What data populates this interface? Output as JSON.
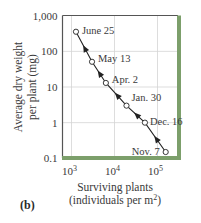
{
  "panel_label": "(b)",
  "colors": {
    "frame": "#555555",
    "accent_bar": "#7c9f6b",
    "grid": "#d4d4d4",
    "line": "#222222"
  },
  "chart_data": {
    "type": "line",
    "title": "",
    "xlabel": "Surviving plants",
    "xlabel_line2": "(individuals per m2)",
    "ylabel": "Average dry weight",
    "ylabel_line2": "per plant (mg)",
    "x_scale": "log",
    "y_scale": "log",
    "xlim": [
      600,
      400000
    ],
    "ylim": [
      0.1,
      1000
    ],
    "x_ticks": [
      {
        "value": 1000,
        "base": "10",
        "exp": "3"
      },
      {
        "value": 10000,
        "base": "10",
        "exp": "4"
      },
      {
        "value": 100000,
        "base": "10",
        "exp": "5"
      }
    ],
    "y_ticks": [
      {
        "value": 1000,
        "label": "1,000"
      },
      {
        "value": 100,
        "label": "100"
      },
      {
        "value": 10,
        "label": "10"
      },
      {
        "value": 1,
        "label": "1"
      },
      {
        "value": 0.1,
        "label": "0.1"
      }
    ],
    "grid": true,
    "series": [
      {
        "name": "Self-thinning trajectory",
        "points": [
          {
            "label": "Nov. 7",
            "x": 155000,
            "y": 0.15
          },
          {
            "label": "Dec. 16",
            "x": 51000,
            "y": 1.0
          },
          {
            "label": "Jan. 30",
            "x": 19000,
            "y": 3.0
          },
          {
            "label": "Apr. 2",
            "x": 6300,
            "y": 13
          },
          {
            "label": "May 13",
            "x": 3000,
            "y": 51
          },
          {
            "label": "June 25",
            "x": 1270,
            "y": 355
          }
        ]
      }
    ],
    "annotations": [
      "June 25",
      "May 13",
      "Apr. 2",
      "Jan. 30",
      "Dec. 16",
      "Nov. 7"
    ],
    "arrow_direction": "from Nov. 7 toward June 25"
  }
}
